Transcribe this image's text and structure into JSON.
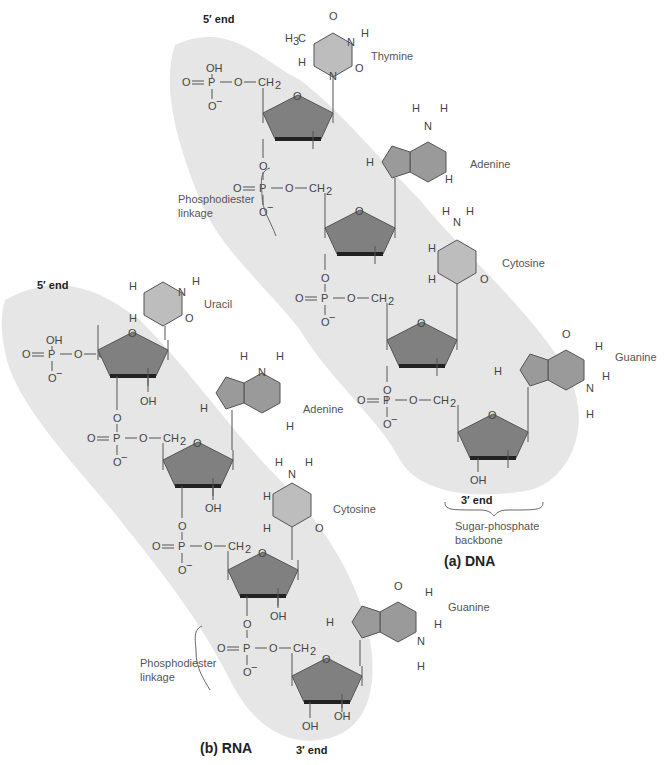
{
  "figure": {
    "panels": [
      {
        "id": "dna",
        "caption": "(a) DNA",
        "five_prime_label": "5′ end",
        "three_prime_label": "3′ end",
        "bases": [
          {
            "name": "Thymine"
          },
          {
            "name": "Adenine"
          },
          {
            "name": "Cytosine"
          },
          {
            "name": "Guanine"
          }
        ],
        "linkage_label_line1": "Phosphodiester",
        "linkage_label_line2": "linkage",
        "backbone_label_line1": "Sugar-phosphate",
        "backbone_label_line2": "backbone"
      },
      {
        "id": "rna",
        "caption": "(b) RNA",
        "five_prime_label": "5′ end",
        "three_prime_label": "3′ end",
        "bases": [
          {
            "name": "Uracil"
          },
          {
            "name": "Adenine"
          },
          {
            "name": "Cytosine"
          },
          {
            "name": "Guanine"
          }
        ],
        "linkage_label_line1": "Phosphodiester",
        "linkage_label_line2": "linkage"
      }
    ],
    "atoms": {
      "phosphate_top": "OH",
      "phosphate_p": "P",
      "oxygen": "O",
      "o_minus": "O",
      "minus": "−",
      "ch2": "CH",
      "two": "2",
      "h": "H",
      "n": "N",
      "oh": "OH",
      "h3c": "H",
      "three": "3",
      "c": "C"
    },
    "colors": {
      "band": "#e6e6e6",
      "sugar_fill": "#808080",
      "purine_fill": "#9a9a9a",
      "pyrimidine_fill": "#bdbdbd",
      "bond": "#555555"
    }
  }
}
